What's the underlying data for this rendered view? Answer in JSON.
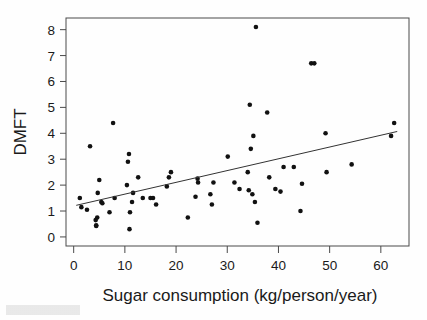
{
  "figure": {
    "background_color": "#fefefe",
    "point_color": "#111111",
    "line_color": "#333333",
    "axis_color": "#4a4a4a"
  },
  "chart_data": {
    "type": "scatter",
    "title": "",
    "xlabel": "Sugar consumption (kg/person/year)",
    "ylabel": "DMFT",
    "xlim": [
      -1.5,
      65.5
    ],
    "ylim": [
      -0.35,
      8.45
    ],
    "xticks": [
      0,
      10,
      20,
      30,
      40,
      50,
      60
    ],
    "yticks": [
      0,
      1,
      2,
      3,
      4,
      5,
      6,
      7,
      8
    ],
    "xtick_labels": [
      "0",
      "10",
      "20",
      "30",
      "40",
      "50",
      "60"
    ],
    "ytick_labels": [
      "0",
      "1",
      "2",
      "3",
      "4",
      "5",
      "6",
      "7",
      "8"
    ],
    "grid": false,
    "legend": "none",
    "points": [
      [
        1.2,
        1.5
      ],
      [
        1.5,
        1.15
      ],
      [
        2.6,
        1.05
      ],
      [
        3.2,
        3.5
      ],
      [
        4.3,
        0.65
      ],
      [
        4.4,
        0.45
      ],
      [
        4.4,
        0.42
      ],
      [
        4.6,
        0.75
      ],
      [
        4.7,
        1.7
      ],
      [
        5.0,
        2.2
      ],
      [
        5.4,
        1.35
      ],
      [
        5.6,
        1.3
      ],
      [
        7.0,
        0.95
      ],
      [
        7.7,
        4.4
      ],
      [
        8.0,
        1.5
      ],
      [
        10.4,
        2.0
      ],
      [
        10.6,
        2.9
      ],
      [
        10.8,
        3.2
      ],
      [
        10.9,
        0.3
      ],
      [
        11.0,
        0.95
      ],
      [
        11.4,
        1.35
      ],
      [
        11.6,
        1.7
      ],
      [
        12.6,
        2.3
      ],
      [
        13.5,
        1.5
      ],
      [
        15.0,
        1.5
      ],
      [
        15.5,
        1.5
      ],
      [
        16.1,
        1.25
      ],
      [
        18.2,
        1.95
      ],
      [
        18.6,
        2.3
      ],
      [
        19.0,
        2.5
      ],
      [
        22.3,
        0.75
      ],
      [
        23.8,
        1.55
      ],
      [
        24.2,
        2.25
      ],
      [
        24.3,
        2.1
      ],
      [
        26.7,
        1.65
      ],
      [
        27.0,
        1.25
      ],
      [
        27.3,
        2.1
      ],
      [
        30.1,
        3.1
      ],
      [
        31.4,
        2.1
      ],
      [
        32.4,
        1.85
      ],
      [
        34.0,
        2.5
      ],
      [
        34.2,
        1.8
      ],
      [
        34.4,
        5.1
      ],
      [
        34.6,
        3.4
      ],
      [
        34.9,
        1.65
      ],
      [
        35.1,
        3.9
      ],
      [
        35.4,
        1.35
      ],
      [
        35.6,
        8.1
      ],
      [
        35.9,
        0.55
      ],
      [
        37.8,
        4.8
      ],
      [
        38.2,
        2.3
      ],
      [
        39.4,
        1.85
      ],
      [
        40.4,
        1.75
      ],
      [
        41.0,
        2.7
      ],
      [
        43.0,
        2.7
      ],
      [
        44.3,
        1.0
      ],
      [
        44.6,
        2.05
      ],
      [
        46.4,
        6.7
      ],
      [
        47.0,
        6.7
      ],
      [
        49.2,
        4.0
      ],
      [
        49.4,
        2.5
      ],
      [
        54.3,
        2.8
      ],
      [
        62.0,
        3.9
      ],
      [
        62.6,
        4.4
      ]
    ],
    "fit_line": {
      "label": "least-squares regression line",
      "x_start": 0.5,
      "y_start": 1.22,
      "x_end": 63.2,
      "y_end": 4.07
    }
  }
}
